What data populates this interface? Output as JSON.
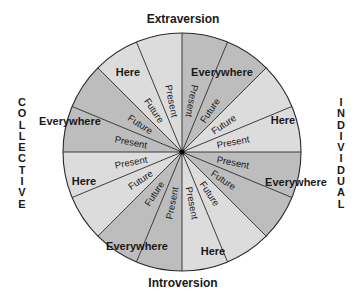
{
  "axes": {
    "top": "Extraversion",
    "bottom": "Introversion",
    "left": "COLLECTIVE",
    "right": "INDIVIDUAL"
  },
  "colors": {
    "dark_fill": "#bdbdbd",
    "light_fill": "#dcdcdc",
    "line": "#2a2a2a",
    "text": "#1a1a1a"
  },
  "wheel": {
    "center": [
      182,
      152
    ],
    "radius": 119,
    "sector_count": 16,
    "sector_degrees": 22.5,
    "sectors": [
      {
        "start": 0,
        "end": 22.5,
        "shade": "dark",
        "label": "Present",
        "rotate": 101
      },
      {
        "start": 22.5,
        "end": 45,
        "shade": "dark",
        "label": "Future",
        "rotate": -56
      },
      {
        "start": 45,
        "end": 67.5,
        "shade": "light",
        "label": "Future",
        "rotate": -34
      },
      {
        "start": 67.5,
        "end": 90,
        "shade": "light",
        "label": "Present",
        "rotate": -11
      },
      {
        "start": 90,
        "end": 112.5,
        "shade": "dark",
        "label": "Present",
        "rotate": 11
      },
      {
        "start": 112.5,
        "end": 135,
        "shade": "dark",
        "label": "Future",
        "rotate": 34
      },
      {
        "start": 135,
        "end": 157.5,
        "shade": "light",
        "label": "Future",
        "rotate": 56
      },
      {
        "start": 157.5,
        "end": 180,
        "shade": "light",
        "label": "Present",
        "rotate": 79
      },
      {
        "start": 180,
        "end": 202.5,
        "shade": "dark",
        "label": "Present",
        "rotate": -79
      },
      {
        "start": 202.5,
        "end": 225,
        "shade": "dark",
        "label": "Future",
        "rotate": -56
      },
      {
        "start": 225,
        "end": 247.5,
        "shade": "light",
        "label": "Future",
        "rotate": -34
      },
      {
        "start": 247.5,
        "end": 270,
        "shade": "light",
        "label": "Present",
        "rotate": -11
      },
      {
        "start": 270,
        "end": 292.5,
        "shade": "dark",
        "label": "Present",
        "rotate": 11
      },
      {
        "start": 292.5,
        "end": 315,
        "shade": "dark",
        "label": "Future",
        "rotate": 34
      },
      {
        "start": 315,
        "end": 337.5,
        "shade": "light",
        "label": "Future",
        "rotate": 56
      },
      {
        "start": 337.5,
        "end": 360,
        "shade": "light",
        "label": "Present",
        "rotate": 79
      }
    ],
    "place_labels": [
      {
        "text": "Everywhere",
        "x": 222,
        "y": 76
      },
      {
        "text": "Here",
        "x": 283,
        "y": 124
      },
      {
        "text": "Everywhere",
        "x": 296,
        "y": 186
      },
      {
        "text": "Here",
        "x": 213,
        "y": 255
      },
      {
        "text": "Everywhere",
        "x": 137,
        "y": 250
      },
      {
        "text": "Here",
        "x": 84,
        "y": 185
      },
      {
        "text": "Everywhere",
        "x": 70,
        "y": 125
      },
      {
        "text": "Here",
        "x": 128,
        "y": 76
      }
    ]
  }
}
